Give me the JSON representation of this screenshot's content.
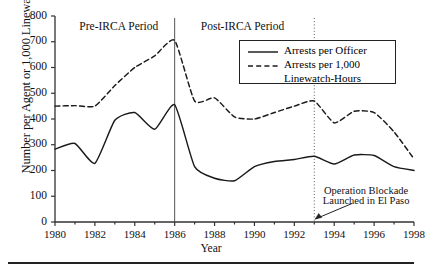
{
  "chart_data": {
    "type": "line",
    "title": "",
    "xlabel": "Year",
    "ylabel": "Number per Agent or 1,000 Linewatch-Hours",
    "xlim": [
      1980,
      1998
    ],
    "ylim": [
      0,
      800
    ],
    "grid": false,
    "legend_position": "top-right",
    "x_ticks": [
      "1980",
      "1982",
      "1984",
      "1986",
      "1988",
      "1990",
      "1992",
      "1994",
      "1996",
      "1998"
    ],
    "y_ticks": [
      "0",
      "100",
      "200",
      "300",
      "400",
      "500",
      "600",
      "700",
      "800"
    ],
    "x": [
      1980,
      1981,
      1982,
      1983,
      1984,
      1985,
      1986,
      1987,
      1988,
      1989,
      1990,
      1991,
      1992,
      1993,
      1994,
      1995,
      1996,
      1997,
      1998
    ],
    "series": [
      {
        "name": "Arrests per Officer",
        "style": "solid",
        "color": "#1a1a1a",
        "values": [
          283,
          305,
          228,
          395,
          425,
          360,
          455,
          215,
          170,
          160,
          215,
          235,
          243,
          255,
          225,
          260,
          258,
          215,
          200
        ]
      },
      {
        "name": "Arrests per 1,000 Linewatch-Hours",
        "style": "dashed",
        "color": "#1a1a1a",
        "values": [
          450,
          452,
          450,
          530,
          600,
          645,
          705,
          470,
          482,
          408,
          400,
          425,
          450,
          470,
          385,
          430,
          425,
          350,
          245
        ]
      }
    ],
    "annotations": [
      {
        "name": "pre-irca-period",
        "text": "Pre-IRCA Period",
        "x": 1983.2,
        "y": 760
      },
      {
        "name": "post-irca-period",
        "text": "Post-IRCA Period",
        "x": 1989.4,
        "y": 760
      },
      {
        "name": "operation-blockade-line1",
        "text": "Operation Blockade",
        "x": 1995.6,
        "y": 120
      },
      {
        "name": "operation-blockade-line2",
        "text": "Launched in El Paso",
        "x": 1995.6,
        "y": 80
      }
    ],
    "vlines": [
      {
        "name": "irca-1986-divider",
        "x": 1986,
        "style": "solid"
      },
      {
        "name": "operation-blockade-1993-divider",
        "x": 1993,
        "style": "dotted"
      }
    ]
  },
  "legend": {
    "entries": [
      {
        "label": "Arrests per Officer",
        "style": "solid"
      },
      {
        "label": "Arrests per 1,000",
        "style": "dashed"
      }
    ],
    "continuation": "Linewatch-Hours"
  },
  "footer": {
    "rule": ""
  }
}
